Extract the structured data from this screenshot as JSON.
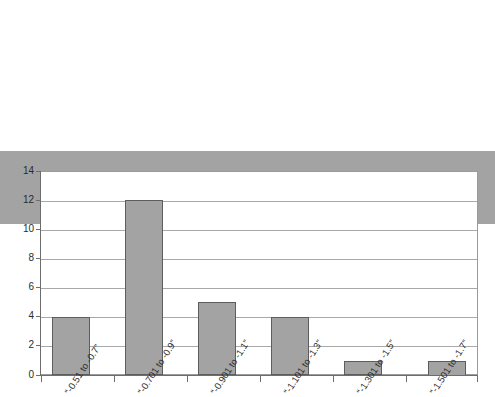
{
  "chart_data": {
    "type": "bar",
    "title": "",
    "subtitle": "",
    "xlabel": "",
    "ylabel": "",
    "categories": [
      "“-0.51 to -0.7”",
      "“-0.701 to -0.9”",
      "“-0.901 to -1.1”",
      "“-1.101 to -1.3”",
      "“-1.301 to -1.5”",
      "“-1.501 to -1.7”"
    ],
    "values": [
      5,
      4,
      12,
      5,
      4,
      1
    ],
    "ylim": [
      0,
      14
    ],
    "ytick_labels": [
      "0",
      "2",
      "4",
      "6",
      "8",
      "10",
      "12",
      "14"
    ],
    "ytick_values": [
      0,
      2,
      4,
      6,
      8,
      10,
      12,
      14
    ],
    "grid": true,
    "legend": false,
    "legend_position": "none",
    "bar_color": "#a3a3a3",
    "bar_border_color": "#5d5d5d",
    "gridline_color": "#a8a8a8",
    "axis_color": "#6d6d6d",
    "plot_background": "#ffffff"
  }
}
